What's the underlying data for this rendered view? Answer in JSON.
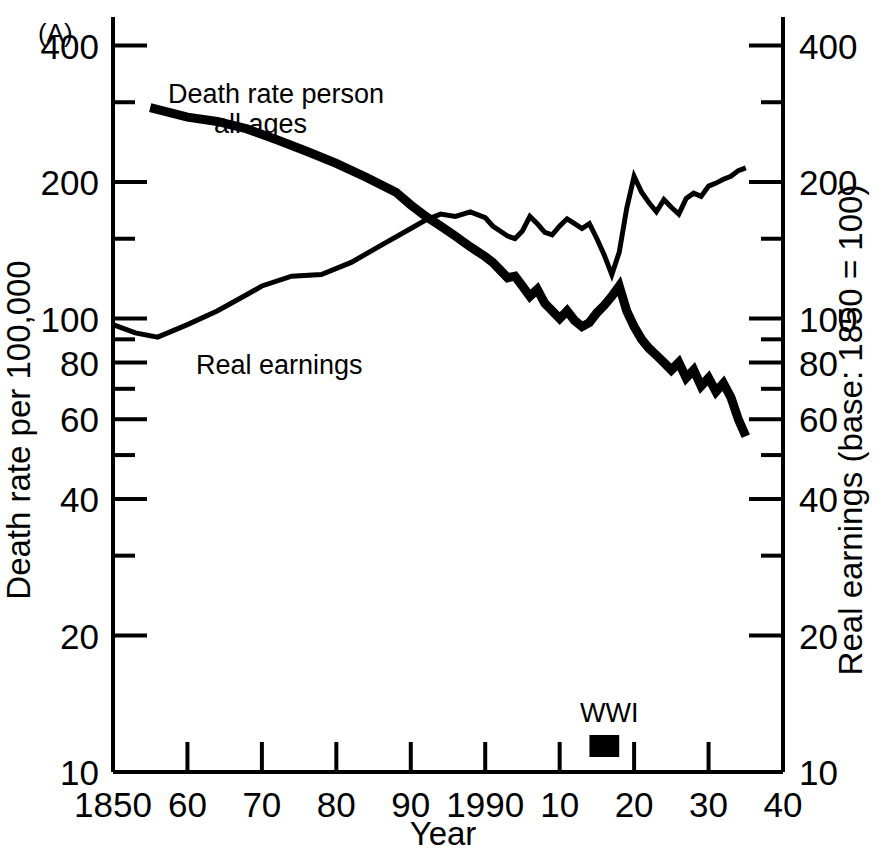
{
  "panel": {
    "label": "(A)"
  },
  "axes": {
    "x_title": "Year",
    "y_left_title": "Death rate per 100,000",
    "y_right_title": "Real earnings (base: 1850 = 100)",
    "x_tick_labels": [
      "1850",
      "60",
      "70",
      "80",
      "90",
      "1990",
      "10",
      "20",
      "30",
      "40"
    ],
    "x_tick_years": [
      1850,
      1860,
      1870,
      1880,
      1890,
      1900,
      1910,
      1920,
      1930,
      1940
    ],
    "y_left_tick_labels": [
      "400",
      "200",
      "100",
      "80",
      "60",
      "40",
      "20",
      "10"
    ],
    "y_left_tick_values": [
      400,
      200,
      100,
      80,
      60,
      40,
      20,
      10
    ],
    "y_left_minor_values": [
      300,
      150,
      90,
      70,
      50,
      30
    ],
    "y_right_tick_labels": [
      "400",
      "200",
      "100",
      "80",
      "60",
      "40",
      "20",
      "10"
    ],
    "y_right_tick_values": [
      400,
      200,
      100,
      80,
      60,
      40,
      20,
      10
    ],
    "y_right_minor_values": [
      300,
      150,
      90,
      70,
      50,
      30
    ]
  },
  "annotations": {
    "death_rate_label_line1": "Death rate person",
    "death_rate_label_line2": "all ages",
    "real_earnings_label": "Real earnings",
    "wwi_label": "WWI",
    "wwi_start": 1914,
    "wwi_end": 1918
  },
  "style": {
    "line_color": "#000000",
    "background": "#ffffff",
    "axis_color": "#000000"
  },
  "chart_data": {
    "type": "line",
    "title": "",
    "xlabel": "Year",
    "ylabel": "Death rate per 100,000",
    "ylabel_right": "Real earnings (base: 1850 = 100)",
    "xlim": [
      1850,
      1940
    ],
    "ylim": [
      10,
      460
    ],
    "yscale": "log",
    "xscale": "linear",
    "grid": false,
    "legend": "inline-annotations",
    "series": [
      {
        "name": "Death rate person all ages",
        "axis": "left",
        "stroke_width": "thick",
        "x": [
          1855,
          1860,
          1864,
          1868,
          1872,
          1876,
          1880,
          1884,
          1888,
          1890,
          1892,
          1894,
          1896,
          1898,
          1900,
          1901,
          1902,
          1903,
          1904,
          1905,
          1906,
          1907,
          1908,
          1909,
          1910,
          1911,
          1912,
          1913,
          1914,
          1915,
          1916,
          1917,
          1918,
          1919,
          1920,
          1921,
          1922,
          1923,
          1924,
          1925,
          1926,
          1927,
          1928,
          1929,
          1930,
          1931,
          1932,
          1933,
          1934,
          1935
        ],
        "y": [
          292,
          278,
          272,
          262,
          248,
          234,
          220,
          205,
          190,
          178,
          168,
          160,
          152,
          144,
          137,
          133,
          128,
          123,
          124,
          118,
          112,
          116,
          108,
          104,
          100,
          104,
          99,
          96,
          98,
          103,
          107,
          112,
          118,
          104,
          96,
          90,
          86,
          83,
          80,
          77,
          80,
          74,
          77,
          71,
          74,
          69,
          72,
          67,
          60,
          55
        ]
      },
      {
        "name": "Real earnings",
        "axis": "right",
        "stroke_width": "thin",
        "x": [
          1850,
          1853,
          1856,
          1860,
          1864,
          1868,
          1870,
          1874,
          1878,
          1882,
          1886,
          1890,
          1892,
          1894,
          1896,
          1898,
          1900,
          1901,
          1902,
          1903,
          1904,
          1905,
          1906,
          1907,
          1908,
          1909,
          1910,
          1911,
          1912,
          1913,
          1914,
          1915,
          1916,
          1917,
          1918,
          1919,
          1920,
          1921,
          1922,
          1923,
          1924,
          1925,
          1926,
          1927,
          1928,
          1929,
          1930,
          1931,
          1932,
          1933,
          1934,
          1935
        ],
        "y": [
          97,
          93,
          91,
          97,
          104,
          113,
          118,
          124,
          125,
          133,
          145,
          158,
          165,
          170,
          168,
          172,
          167,
          160,
          156,
          152,
          150,
          156,
          168,
          162,
          155,
          153,
          160,
          166,
          162,
          158,
          162,
          150,
          138,
          125,
          140,
          175,
          206,
          190,
          180,
          172,
          183,
          176,
          170,
          184,
          189,
          186,
          196,
          199,
          203,
          206,
          212,
          215
        ]
      }
    ]
  }
}
